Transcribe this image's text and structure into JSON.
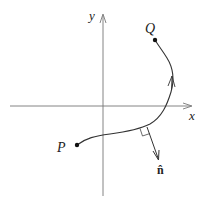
{
  "diagram": {
    "axes": {
      "x_label": "x",
      "y_label": "y"
    },
    "points": [
      {
        "id": "P",
        "label": "P",
        "x": 77,
        "y": 145
      },
      {
        "id": "Q",
        "label": "Q",
        "x": 155,
        "y": 40
      }
    ],
    "curve": {
      "from": "P",
      "to": "Q",
      "direction_arrow": "toward Q"
    },
    "normal_vector": {
      "label": "n̂",
      "right_angle_marker": true
    },
    "colors": {
      "line": "#555555",
      "curve": "#333333",
      "text": "#222222"
    }
  }
}
